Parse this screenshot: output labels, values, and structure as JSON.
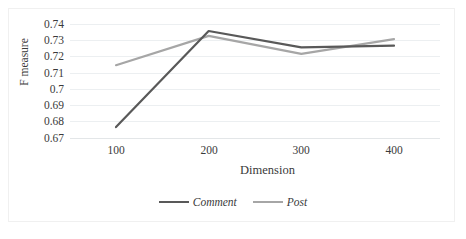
{
  "chart_data": {
    "type": "line",
    "title": "",
    "xlabel": "Dimension",
    "ylabel": "F measure",
    "categories": [
      "100",
      "200",
      "300",
      "400"
    ],
    "x": [
      100,
      200,
      300,
      400
    ],
    "series": [
      {
        "name": "Comment",
        "color": "#595959",
        "values": [
          0.677,
          0.736,
          0.726,
          0.727
        ]
      },
      {
        "name": "Post",
        "color": "#a6a6a6",
        "values": [
          0.715,
          0.733,
          0.722,
          0.731
        ]
      }
    ],
    "ylim": [
      0.67,
      0.74
    ],
    "yticks": [
      0.74,
      0.73,
      0.72,
      0.71,
      0.7,
      0.69,
      0.68,
      0.67
    ],
    "ytick_labels": [
      "0.74",
      "0.73",
      "0.72",
      "0.71",
      "0.7",
      "0.69",
      "0.68",
      "0.67"
    ],
    "xtick_labels": [
      "100",
      "200",
      "300",
      "400"
    ],
    "grid": true,
    "grid_axis": "y",
    "grid_color": "#eceff1",
    "legend_position": "bottom",
    "legend": [
      "Comment",
      "Post"
    ],
    "background_color": "#ffffff",
    "border_color": "#f0f0f0"
  }
}
